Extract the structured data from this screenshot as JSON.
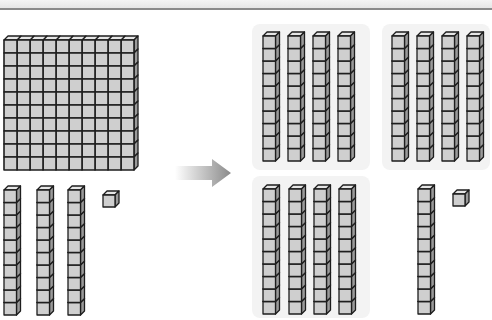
{
  "diagram": {
    "colors": {
      "cube_front": "#cfcfcf",
      "cube_top": "#e6e6e6",
      "cube_side": "#9a9a9a",
      "edge": "#1e1e1e",
      "group_bg": "#f3f3f3",
      "arrow_start": "#ffffff",
      "arrow_end": "#8a8a8a"
    },
    "left": {
      "flats": 1,
      "rods": 3,
      "units": 1,
      "flat_grid": "10x10"
    },
    "right": {
      "rod_groups": [
        {
          "name": "top-left-group",
          "rods": 4
        },
        {
          "name": "top-right-group",
          "rods": 4
        },
        {
          "name": "bottom-left-group",
          "rods": 4
        }
      ],
      "extra_rods": 1,
      "units": 1
    },
    "arrow": {
      "direction": "right",
      "icon": "arrow-right-icon"
    }
  }
}
